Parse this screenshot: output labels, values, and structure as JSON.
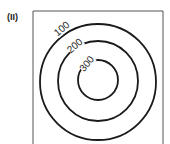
{
  "panel_label": "(II)",
  "contours": [
    {
      "level": "100",
      "radius": 58
    },
    {
      "level": "200",
      "radius": 40
    },
    {
      "level": "300",
      "radius": 20
    }
  ],
  "colors": {
    "line": "#1a1a1a",
    "frame": "#555555",
    "background": "#ffffff"
  }
}
